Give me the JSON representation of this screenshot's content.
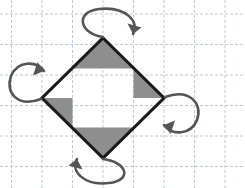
{
  "figure": {
    "width": 245,
    "height": 188,
    "background_color": "#ffffff"
  },
  "grid": {
    "name": "graph-paper-grid",
    "line_color": "#b9c4d4",
    "line_width": 0.9,
    "dash_pattern": "3 2",
    "cell_size": 30.5,
    "vertical_lines_x": [
      11.5,
      42,
      72.5,
      103,
      133.5,
      164,
      194.5,
      225
    ],
    "horizontal_lines_y": [
      14,
      44.5,
      75,
      105.5,
      136,
      166.5
    ],
    "visible": true
  },
  "diamond": {
    "name": "rotated-square",
    "stroke_color": "#1a1a1a",
    "stroke_width": 3.1,
    "fill": "none",
    "vertices": {
      "top": [
        103,
        38
      ],
      "right": [
        164,
        98
      ],
      "bottom": [
        103,
        158
      ],
      "left": [
        42,
        98
      ]
    },
    "points_attr": "103,38 164,98 103,158 42,98"
  },
  "shaded_triangles": {
    "fill_color": "#8e8e8e",
    "count": 4,
    "items": [
      {
        "name": "shaded-triangle-top",
        "points": "103,38 133.5,68.5 72.5,68.5",
        "position": "top"
      },
      {
        "name": "shaded-triangle-right",
        "points": "164,98 133.5,68.5 133.5,98",
        "position": "right"
      },
      {
        "name": "shaded-triangle-bottom",
        "points": "103,158 72.5,127.5 133.5,127.5",
        "position": "bottom"
      },
      {
        "name": "shaded-triangle-left",
        "points": "42,98 72.5,127.5 72.5,98",
        "position": "left"
      }
    ]
  },
  "rotation_arrows": {
    "stroke_color": "#555555",
    "stroke_width": 2.6,
    "head_color": "#555555",
    "count": 4,
    "items": [
      {
        "name": "rotation-arrow-top",
        "position": "top",
        "path": "M 103,37 C 80,34 74,12 99,9 C 126,6 140,22 133,34",
        "head_points": "133,34 127.5,23.5 141.5,27.5",
        "direction": "clockwise"
      },
      {
        "name": "rotation-arrow-right",
        "position": "right",
        "path": "M 165,97 C 190,88 203,104 197,120 C 191,135 172,136 164,125",
        "head_points": "164,125 175,120.5 170.5,134",
        "direction": "clockwise"
      },
      {
        "name": "rotation-arrow-bottom",
        "position": "bottom",
        "path": "M 103,159 C 127,162 133,180 109,183 C 84,186 70,171 77,159",
        "head_points": "77,159 82.5,169.5 68.5,165.5",
        "direction": "clockwise"
      },
      {
        "name": "rotation-arrow-left",
        "position": "left",
        "path": "M 41,99 C 17,108 5,92 11,76 C 17,61 36,60 44,71",
        "head_points": "44,71 33,75.5 37.5,62",
        "direction": "clockwise"
      }
    ]
  }
}
